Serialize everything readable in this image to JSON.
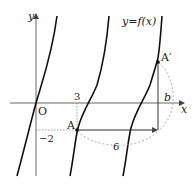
{
  "figure": {
    "curve_label": "y=f(x)",
    "axis_x_label": "x",
    "axis_y_label": "y",
    "origin_label": "O",
    "point_a_label": "A",
    "point_a_prime_label": "A′",
    "tick_x_label": "3",
    "tick_y_label": "−2",
    "horizontal_shift_label": "6",
    "vertical_shift_label": "b"
  },
  "colors": {
    "curve": "#111111",
    "axis": "#555555",
    "dashed": "#888888"
  }
}
